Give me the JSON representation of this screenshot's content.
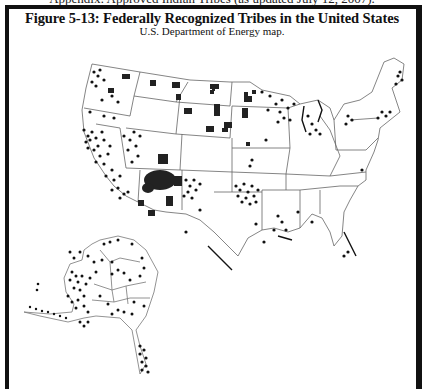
{
  "document": {
    "clipped_header_text": "Appendix: Approved Indian Tribes (as updated July 12, 2007).",
    "figure": {
      "title": "Figure 5-13: Federally Recognized Tribes in the United States",
      "subtitle": "U.S. Department of Energy map.",
      "map": {
        "type": "choropleth-dot map",
        "regions": [
          "Contiguous United States",
          "Alaska"
        ],
        "legend": "none visible",
        "symbols": {
          "dot": "tribal entity location",
          "filled_area": "reservation land"
        },
        "colors": {
          "ink": "#111111",
          "borders": "#888888",
          "background": "#ffffff"
        }
      }
    }
  }
}
